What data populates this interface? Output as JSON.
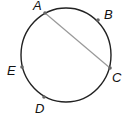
{
  "diagram": {
    "type": "circle-with-chord",
    "circle": {
      "cx": 66,
      "cy": 55,
      "rx": 45,
      "ry": 47,
      "stroke": "#222222"
    },
    "chord": {
      "from": "A",
      "to": "C",
      "stroke": "#999999"
    },
    "points": [
      {
        "id": "A",
        "label": "A",
        "x": 45,
        "y": 13,
        "lx": 33,
        "ly": 10
      },
      {
        "id": "B",
        "label": "B",
        "x": 98,
        "y": 20,
        "lx": 104,
        "ly": 18
      },
      {
        "id": "C",
        "label": "C",
        "x": 110,
        "y": 68,
        "lx": 112,
        "ly": 82
      },
      {
        "id": "E",
        "label": "E",
        "x": 22,
        "y": 67,
        "lx": 7,
        "ly": 75
      },
      {
        "id": "D",
        "label": "D",
        "x": 44,
        "y": 97,
        "lx": 35,
        "ly": 112
      }
    ]
  }
}
